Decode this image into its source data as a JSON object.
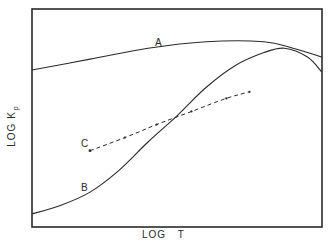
{
  "chart_data": {
    "type": "line",
    "title": "",
    "xlabel": "LOG T",
    "ylabel": "LOG Kp",
    "ylabel_main": "LOG K",
    "ylabel_sub": "p",
    "grid": false,
    "ticks": false,
    "axis_note": "Qualitative plot; no numeric tick labels. Values normalized 0-1 over plot frame.",
    "xlim": [
      0,
      1
    ],
    "ylim": [
      0,
      1
    ],
    "series": [
      {
        "name": "A",
        "style": "solid",
        "points": [
          [
            0.0,
            0.72
          ],
          [
            0.2,
            0.77
          ],
          [
            0.4,
            0.82
          ],
          [
            0.6,
            0.85
          ],
          [
            0.8,
            0.85
          ],
          [
            0.9,
            0.82
          ],
          [
            1.0,
            0.78
          ]
        ]
      },
      {
        "name": "B",
        "style": "solid",
        "points": [
          [
            0.0,
            0.06
          ],
          [
            0.1,
            0.1
          ],
          [
            0.2,
            0.16
          ],
          [
            0.3,
            0.26
          ],
          [
            0.4,
            0.39
          ],
          [
            0.5,
            0.51
          ],
          [
            0.6,
            0.64
          ],
          [
            0.7,
            0.74
          ],
          [
            0.8,
            0.8
          ],
          [
            0.87,
            0.82
          ],
          [
            0.95,
            0.78
          ],
          [
            1.0,
            0.71
          ]
        ]
      },
      {
        "name": "C",
        "style": "dashed",
        "points": [
          [
            0.2,
            0.35
          ],
          [
            0.32,
            0.41
          ],
          [
            0.43,
            0.47
          ],
          [
            0.55,
            0.53
          ],
          [
            0.67,
            0.59
          ],
          [
            0.75,
            0.62
          ]
        ]
      }
    ],
    "annotations": [
      {
        "text": "A",
        "near_series": "A"
      },
      {
        "text": "B",
        "near_series": "B"
      },
      {
        "text": "C",
        "near_series": "C"
      }
    ]
  },
  "labels": {
    "x_axis": "LOG T",
    "y_axis_main": "LOG K",
    "y_axis_sub": "p",
    "curve_a": "A",
    "curve_b": "B",
    "curve_c": "C"
  },
  "colors": {
    "ink": "#2a2a2a",
    "background": "#ffffff"
  }
}
